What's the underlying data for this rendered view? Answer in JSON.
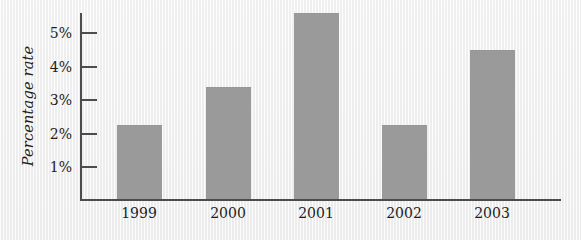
{
  "chart_data": {
    "type": "bar",
    "title": "",
    "subtitle": "",
    "xlabel": "",
    "ylabel": "Percentage rate",
    "categories": [
      "1999",
      "2000",
      "2001",
      "2002",
      "2003"
    ],
    "values": [
      2,
      3,
      5,
      2,
      4
    ],
    "value_unit": "%",
    "ylim": [
      0,
      5
    ],
    "ytick_values": [
      1,
      2,
      3,
      4,
      5
    ],
    "ytick_labels": [
      "1%",
      "2%",
      "3%",
      "4%",
      "5%"
    ],
    "grid": false,
    "legend": null,
    "legend_position": "none",
    "bar_color": "#9a9a9a",
    "axis_color": "#4c4c4c",
    "text_color": "#1d1d1d",
    "background_color": "#f1f1f1",
    "annotations": []
  },
  "figure": {
    "y_axis": {
      "title": "Percentage rate",
      "ticks": [
        {
          "label": "5%",
          "value": 5
        },
        {
          "label": "4%",
          "value": 4
        },
        {
          "label": "3%",
          "value": 3
        },
        {
          "label": "2%",
          "value": 2
        },
        {
          "label": "1%",
          "value": 1
        }
      ]
    },
    "x_axis": {
      "title": "",
      "ticks": [
        {
          "label": "1999"
        },
        {
          "label": "2000"
        },
        {
          "label": "2001"
        },
        {
          "label": "2002"
        },
        {
          "label": "2003"
        }
      ]
    },
    "bars": [
      {
        "category": "1999",
        "value": 2,
        "value_label": "2%"
      },
      {
        "category": "2000",
        "value": 3,
        "value_label": "3%"
      },
      {
        "category": "2001",
        "value": 5,
        "value_label": "5%"
      },
      {
        "category": "2002",
        "value": 2,
        "value_label": "2%"
      },
      {
        "category": "2003",
        "value": 4,
        "value_label": "4%"
      }
    ]
  }
}
